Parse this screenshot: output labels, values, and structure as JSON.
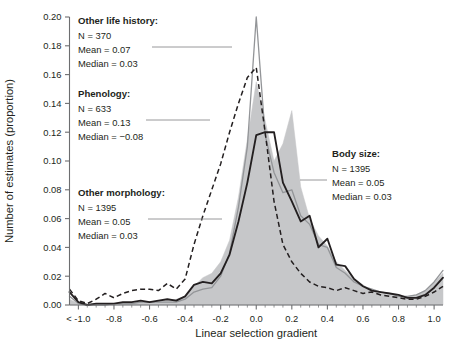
{
  "chart_data": {
    "type": "line",
    "title": "",
    "xlabel": "Linear selection gradient",
    "ylabel": "Number of estimates (proportion)",
    "xlim": [
      -1.05,
      1.05
    ],
    "ylim": [
      0.0,
      0.2
    ],
    "grid": false,
    "legend_position": "inline-annotations",
    "xticks": [
      -1.0,
      -0.8,
      -0.6,
      -0.4,
      -0.2,
      0.0,
      0.2,
      0.4,
      0.6,
      0.8,
      1.0
    ],
    "xtick_labels": [
      "< -1.0",
      "-0.8",
      "-0.6",
      "-0.4",
      "-0.2",
      "0.0",
      "0.2",
      "0.4",
      "0.6",
      "0.8",
      "1.0"
    ],
    "yticks": [
      0.0,
      0.02,
      0.04,
      0.06,
      0.08,
      0.1,
      0.12,
      0.14,
      0.16,
      0.18,
      0.2
    ],
    "ytick_labels": [
      "0.00",
      "0.02",
      "0.04",
      "0.06",
      "0.08",
      "0.10",
      "0.12",
      "0.14",
      "0.16",
      "0.18",
      "0.20"
    ],
    "x": [
      -1.05,
      -1.0,
      -0.95,
      -0.9,
      -0.85,
      -0.8,
      -0.75,
      -0.7,
      -0.65,
      -0.6,
      -0.55,
      -0.5,
      -0.45,
      -0.4,
      -0.35,
      -0.3,
      -0.25,
      -0.2,
      -0.15,
      -0.1,
      -0.05,
      0.0,
      0.05,
      0.1,
      0.15,
      0.2,
      0.25,
      0.3,
      0.35,
      0.4,
      0.45,
      0.5,
      0.55,
      0.6,
      0.65,
      0.7,
      0.75,
      0.8,
      0.85,
      0.9,
      0.95,
      1.0,
      1.05
    ],
    "series": [
      {
        "name": "Body size",
        "style": "filled-area",
        "color": "#c6c7c9",
        "values": [
          0.004,
          0.001,
          0.0,
          0.0,
          0.0,
          0.0,
          0.001,
          0.001,
          0.002,
          0.002,
          0.003,
          0.003,
          0.004,
          0.006,
          0.013,
          0.019,
          0.022,
          0.03,
          0.045,
          0.075,
          0.115,
          0.155,
          0.128,
          0.1,
          0.112,
          0.135,
          0.082,
          0.06,
          0.048,
          0.041,
          0.03,
          0.024,
          0.018,
          0.014,
          0.01,
          0.008,
          0.007,
          0.006,
          0.006,
          0.007,
          0.01,
          0.016,
          0.022
        ]
      },
      {
        "name": "Other morphology",
        "style": "solid-thick-black",
        "color": "#231f20",
        "values": [
          0.009,
          0.002,
          0.0,
          0.001,
          0.001,
          0.001,
          0.002,
          0.002,
          0.003,
          0.002,
          0.003,
          0.004,
          0.003,
          0.006,
          0.014,
          0.016,
          0.015,
          0.022,
          0.035,
          0.058,
          0.085,
          0.118,
          0.12,
          0.12,
          0.085,
          0.072,
          0.058,
          0.062,
          0.04,
          0.046,
          0.028,
          0.027,
          0.018,
          0.013,
          0.01,
          0.009,
          0.008,
          0.007,
          0.005,
          0.005,
          0.007,
          0.012,
          0.019
        ]
      },
      {
        "name": "Other life history",
        "style": "solid-thin-gray",
        "color": "#939598",
        "values": [
          0.006,
          0.001,
          0.0,
          0.0,
          0.0,
          0.001,
          0.001,
          0.001,
          0.002,
          0.002,
          0.002,
          0.002,
          0.002,
          0.004,
          0.009,
          0.011,
          0.012,
          0.02,
          0.036,
          0.068,
          0.11,
          0.2,
          0.118,
          0.092,
          0.078,
          0.08,
          0.062,
          0.056,
          0.042,
          0.04,
          0.026,
          0.022,
          0.016,
          0.013,
          0.011,
          0.009,
          0.008,
          0.006,
          0.006,
          0.007,
          0.01,
          0.016,
          0.024
        ]
      },
      {
        "name": "Phenology",
        "style": "dashed-black",
        "color": "#231f20",
        "values": [
          0.011,
          0.003,
          0.001,
          0.004,
          0.008,
          0.005,
          0.008,
          0.01,
          0.011,
          0.011,
          0.01,
          0.015,
          0.011,
          0.018,
          0.042,
          0.062,
          0.08,
          0.098,
          0.12,
          0.14,
          0.158,
          0.165,
          0.12,
          0.072,
          0.042,
          0.03,
          0.022,
          0.016,
          0.013,
          0.012,
          0.01,
          0.012,
          0.01,
          0.008,
          0.009,
          0.007,
          0.006,
          0.005,
          0.004,
          0.004,
          0.006,
          0.009,
          0.013
        ]
      }
    ],
    "annotations": [
      {
        "id": "other-life-history",
        "title": "Other life history:",
        "n": "N = 370",
        "mean": "Mean = 0.07",
        "median": "Median = 0.03"
      },
      {
        "id": "phenology",
        "title": "Phenology:",
        "n": "N = 633",
        "mean": "Mean = 0.13",
        "median": "Median = −0.08"
      },
      {
        "id": "other-morphology",
        "title": "Other morphology:",
        "n": "N = 1395",
        "mean": "Mean = 0.05",
        "median": "Median = 0.03"
      },
      {
        "id": "body-size",
        "title": "Body size:",
        "n": "N = 1395",
        "mean": "Mean = 0.05",
        "median": "Median = 0.03"
      }
    ]
  }
}
